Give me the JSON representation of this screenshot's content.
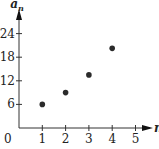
{
  "chart_data": {
    "type": "scatter",
    "title": "",
    "xlabel": "n",
    "ylabel": "a_n",
    "x": [
      1,
      2,
      3,
      4
    ],
    "values": [
      6,
      9,
      13.5,
      20.25
    ],
    "x_ticks": [
      "1",
      "2",
      "3",
      "4",
      "5"
    ],
    "y_ticks": [
      "6",
      "12",
      "18",
      "24"
    ],
    "origin_label": "0",
    "xlim": [
      0,
      5.5
    ],
    "ylim": [
      0,
      25.5
    ],
    "grid": false,
    "legend": null,
    "point_color": "#2b2b2b"
  }
}
